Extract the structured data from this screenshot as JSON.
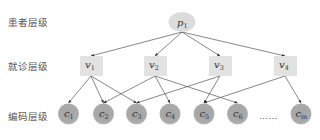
{
  "levels": {
    "patient": "患者层级",
    "visit": "就诊层级",
    "code": "编码层级"
  },
  "nodes": {
    "p1": {
      "base": "p",
      "sub": "1",
      "level": "patient",
      "shape": "ellipse"
    },
    "v1": {
      "base": "v",
      "sub": "1",
      "level": "visit",
      "shape": "rect"
    },
    "v2": {
      "base": "v",
      "sub": "2",
      "level": "visit",
      "shape": "rect"
    },
    "v3": {
      "base": "v",
      "sub": "3",
      "level": "visit",
      "shape": "rect"
    },
    "v4": {
      "base": "v",
      "sub": "4",
      "level": "visit",
      "shape": "rect"
    },
    "c1": {
      "base": "c",
      "sub": "1",
      "level": "code",
      "shape": "circle"
    },
    "c2": {
      "base": "c",
      "sub": "2",
      "level": "code",
      "shape": "circle"
    },
    "c3": {
      "base": "c",
      "sub": "3",
      "level": "code",
      "shape": "circle"
    },
    "c4": {
      "base": "c",
      "sub": "4",
      "level": "code",
      "shape": "circle"
    },
    "c5": {
      "base": "c",
      "sub": "5",
      "level": "code",
      "shape": "circle"
    },
    "c6": {
      "base": "c",
      "sub": "6",
      "level": "code",
      "shape": "circle"
    },
    "cm": {
      "base": "c",
      "sub": "m",
      "level": "code",
      "shape": "circle"
    }
  },
  "ellipsis": "……",
  "edges": [
    [
      "p1",
      "v1"
    ],
    [
      "p1",
      "v2"
    ],
    [
      "p1",
      "v3"
    ],
    [
      "p1",
      "v4"
    ],
    [
      "v1",
      "c1"
    ],
    [
      "v1",
      "c2"
    ],
    [
      "v1",
      "c3"
    ],
    [
      "v2",
      "c2"
    ],
    [
      "v2",
      "c4"
    ],
    [
      "v2",
      "c6"
    ],
    [
      "v3",
      "c3"
    ],
    [
      "v3",
      "c5"
    ],
    [
      "v4",
      "c5"
    ],
    [
      "v4",
      "cm"
    ]
  ],
  "colors": {
    "ellipse_fill": "#dcdcdc",
    "rect_fill": "#e2e2e2",
    "circle_fill": "#a9a9a9",
    "edge": "#555555"
  }
}
